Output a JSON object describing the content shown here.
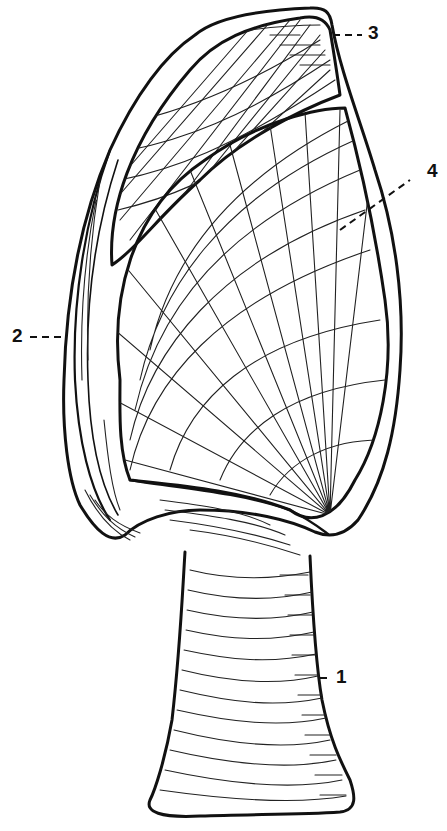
{
  "figure": {
    "background": "#ffffff",
    "ink_color": "#111111"
  },
  "labels": [
    {
      "id": "1",
      "text": "1",
      "x": 336,
      "y": 667
    },
    {
      "id": "2",
      "text": "2",
      "x": 12,
      "y": 324
    },
    {
      "id": "3",
      "text": "3",
      "x": 368,
      "y": 21
    },
    {
      "id": "4",
      "text": "4",
      "x": 428,
      "y": 159
    }
  ]
}
